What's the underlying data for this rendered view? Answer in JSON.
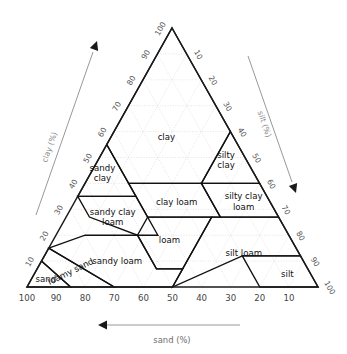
{
  "figure": {
    "kind": "soil-texture-triangle",
    "background_color": "#ffffff",
    "edge_color": "#1a1a1a",
    "grid_color": "#ddd0d0",
    "axis_label_color": "#8a8a8a"
  },
  "chart_data": {
    "type": "ternary",
    "title": "",
    "subtitle": "",
    "grid": true,
    "legend_position": "none",
    "axes": [
      {
        "id": "clay",
        "label": "clay (%)",
        "position": "left",
        "direction": "up-right",
        "arrow": true,
        "range": [
          0,
          100
        ],
        "tick_step": 10,
        "ticks": [
          "10",
          "20",
          "30",
          "40",
          "50",
          "60",
          "70",
          "80",
          "90",
          "100"
        ]
      },
      {
        "id": "silt",
        "label": "silt (%)",
        "position": "right",
        "direction": "down-right",
        "arrow": true,
        "range": [
          0,
          100
        ],
        "tick_step": 10,
        "ticks": [
          "10",
          "20",
          "30",
          "40",
          "50",
          "60",
          "70",
          "80",
          "90",
          "100"
        ]
      },
      {
        "id": "sand",
        "label": "sand (%)",
        "position": "bottom",
        "direction": "right-to-left",
        "arrow": true,
        "range": [
          0,
          100
        ],
        "tick_step": 10,
        "ticks": [
          "100",
          "90",
          "80",
          "70",
          "60",
          "50",
          "40",
          "30",
          "20",
          "10"
        ]
      }
    ],
    "classes": [
      {
        "name": "clay",
        "label": "clay",
        "label_lines": [
          "clay"
        ],
        "vertices": [
          [
            0,
            100,
            0
          ],
          [
            0,
            60,
            40
          ],
          [
            20,
            40,
            40
          ],
          [
            45,
            40,
            15
          ],
          [
            45,
            55,
            0
          ]
        ]
      },
      {
        "name": "silty-clay",
        "label": "silty clay",
        "label_lines": [
          "silty",
          "clay"
        ],
        "vertices": [
          [
            0,
            60,
            40
          ],
          [
            0,
            40,
            60
          ],
          [
            20,
            40,
            40
          ]
        ]
      },
      {
        "name": "sandy-clay",
        "label": "sandy clay",
        "label_lines": [
          "sandy",
          "clay"
        ],
        "vertices": [
          [
            45,
            55,
            0
          ],
          [
            45,
            35,
            20
          ],
          [
            65,
            35,
            0
          ]
        ]
      },
      {
        "name": "silty-clay-loam",
        "label": "silty clay loam",
        "label_lines": [
          "silty clay",
          "loam"
        ],
        "vertices": [
          [
            0,
            40,
            60
          ],
          [
            0,
            27,
            73
          ],
          [
            20,
            27,
            53
          ],
          [
            20,
            40,
            40
          ]
        ]
      },
      {
        "name": "clay-loam",
        "label": "clay loam",
        "label_lines": [
          "clay loam"
        ],
        "vertices": [
          [
            20,
            40,
            40
          ],
          [
            20,
            27,
            53
          ],
          [
            45,
            27,
            28
          ],
          [
            45,
            40,
            15
          ]
        ]
      },
      {
        "name": "sandy-clay-loam",
        "label": "sandy clay loam",
        "label_lines": [
          "sandy clay",
          "loam"
        ],
        "vertices": [
          [
            45,
            35,
            20
          ],
          [
            45,
            20,
            35
          ],
          [
            52,
            20,
            28
          ],
          [
            65,
            27,
            8
          ],
          [
            65,
            35,
            0
          ]
        ]
      },
      {
        "name": "loam",
        "label": "loam",
        "label_lines": [
          "loam"
        ],
        "vertices": [
          [
            23,
            27,
            50
          ],
          [
            45,
            27,
            28
          ],
          [
            52,
            20,
            28
          ],
          [
            52,
            7,
            41
          ],
          [
            43,
            7,
            50
          ]
        ]
      },
      {
        "name": "silt-loam",
        "label": "silt loam",
        "label_lines": [
          "silt loam"
        ],
        "vertices": [
          [
            0,
            27,
            73
          ],
          [
            0,
            12,
            88
          ],
          [
            20,
            12,
            68
          ],
          [
            50,
            0,
            50
          ],
          [
            43,
            7,
            50
          ],
          [
            23,
            27,
            50
          ]
        ]
      },
      {
        "name": "silt",
        "label": "silt",
        "label_lines": [
          "silt"
        ],
        "vertices": [
          [
            0,
            12,
            88
          ],
          [
            0,
            0,
            100
          ],
          [
            20,
            0,
            80
          ],
          [
            20,
            12,
            68
          ]
        ]
      },
      {
        "name": "sandy-loam",
        "label": "sandy loam",
        "label_lines": [
          "sandy loam"
        ],
        "vertices": [
          [
            52,
            20,
            28
          ],
          [
            52,
            7,
            41
          ],
          [
            43,
            7,
            50
          ],
          [
            50,
            0,
            50
          ],
          [
            70,
            0,
            30
          ],
          [
            85,
            15,
            0
          ],
          [
            70,
            20,
            10
          ]
        ]
      },
      {
        "name": "loamy-sand",
        "label": "loamy sand",
        "label_lines": [
          "loamy sand"
        ],
        "vertices": [
          [
            70,
            0,
            30
          ],
          [
            85,
            0,
            15
          ],
          [
            90,
            10,
            0
          ],
          [
            85,
            15,
            0
          ]
        ]
      },
      {
        "name": "sand",
        "label": "sand",
        "label_lines": [
          "sand"
        ],
        "vertices": [
          [
            85,
            0,
            15
          ],
          [
            100,
            0,
            0
          ],
          [
            90,
            10,
            0
          ]
        ]
      }
    ]
  }
}
